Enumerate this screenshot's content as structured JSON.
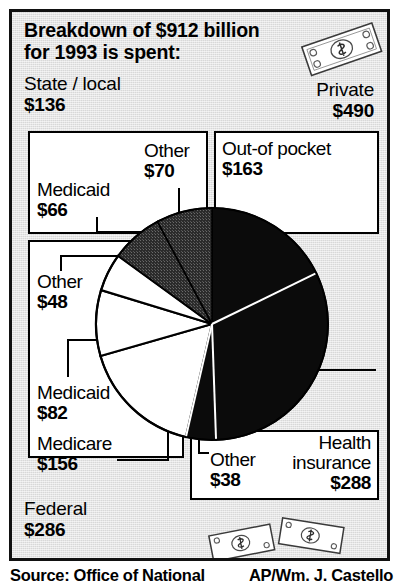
{
  "header": {
    "headline": "Breakdown of $912 billion for 1993 is spent:",
    "headline_line1": "Breakdown of $912 billion",
    "headline_line2": "for 1993 is spent:",
    "left_label": "State / local",
    "left_value": "$136",
    "right_label": "Private",
    "right_value": "$490"
  },
  "footer": {
    "federal_label": "Federal",
    "federal_value": "$286",
    "source": "Source: Office of National",
    "credit": "AP/Wm. J. Castello"
  },
  "labels": {
    "medicaid66_name": "Medicaid",
    "medicaid66_value": "$66",
    "other70_name": "Other",
    "other70_value": "$70",
    "outofpocket_name": "Out-of pocket",
    "outofpocket_value": "$163",
    "other48_name": "Other",
    "other48_value": "$48",
    "medicaid82_name": "Medicaid",
    "medicaid82_value": "$82",
    "medicare156_name": "Medicare",
    "medicare156_value": "$156",
    "other38_name": "Other",
    "other38_value": "$38",
    "health_name_l1": "Health",
    "health_name_l2": "insurance",
    "health_value": "$288"
  },
  "icons": {
    "money_top": "dollar-bill-icon",
    "money_bottom": "dollar-bills-icon"
  },
  "colors": {
    "paper": "#d8d8d8",
    "ink": "#000000",
    "box": "#ffffff",
    "slice_black": "#0b0b0b",
    "slice_gray": "#2e2e2e",
    "slice_white": "#ffffff"
  },
  "chart_data": {
    "type": "pie",
    "title": "Breakdown of $912 billion for 1993 is spent:",
    "unit": "billions of dollars",
    "total": 912,
    "legend": "labeled-callouts",
    "grid": false,
    "groups": [
      {
        "name": "Private",
        "value": 490
      },
      {
        "name": "Federal",
        "value": 286
      },
      {
        "name": "State / local",
        "value": 136
      }
    ],
    "categories": [
      "Out-of pocket",
      "Health insurance",
      "Other",
      "Medicare",
      "Medicaid",
      "Other",
      "Medicaid",
      "Other"
    ],
    "values": [
      163,
      288,
      38,
      156,
      82,
      48,
      66,
      70
    ],
    "slices": [
      {
        "label": "Out-of pocket",
        "value": 163,
        "group": "Private",
        "fill": "#0b0b0b",
        "start_deg": 0,
        "end_deg": 64
      },
      {
        "label": "Health insurance",
        "value": 288,
        "group": "Private",
        "fill": "#0b0b0b",
        "start_deg": 64,
        "end_deg": 178
      },
      {
        "label": "Other",
        "value": 38,
        "group": "Private",
        "fill": "#0b0b0b",
        "start_deg": 178,
        "end_deg": 193
      },
      {
        "label": "Medicare",
        "value": 156,
        "group": "Federal",
        "fill": "#ffffff",
        "start_deg": 193,
        "end_deg": 254
      },
      {
        "label": "Medicaid",
        "value": 82,
        "group": "Federal",
        "fill": "#ffffff",
        "start_deg": 254,
        "end_deg": 287
      },
      {
        "label": "Other",
        "value": 48,
        "group": "Federal",
        "fill": "#ffffff",
        "start_deg": 287,
        "end_deg": 306
      },
      {
        "label": "Medicaid",
        "value": 66,
        "group": "State / local",
        "fill": "#2e2e2e",
        "start_deg": 306,
        "end_deg": 332
      },
      {
        "label": "Other",
        "value": 70,
        "group": "State / local",
        "fill": "#2e2e2e",
        "start_deg": 332,
        "end_deg": 360
      }
    ]
  }
}
